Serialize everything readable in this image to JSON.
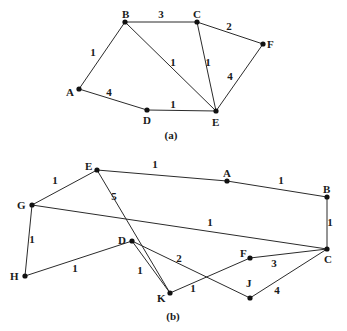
{
  "figures": [
    {
      "id": "a",
      "caption": "(a)",
      "caption_pos": [
        171,
        139
      ],
      "nodes": [
        {
          "id": "A",
          "x": 79,
          "y": 89,
          "lx": 66,
          "ly": 96
        },
        {
          "id": "B",
          "x": 125,
          "y": 22,
          "lx": 122,
          "ly": 18
        },
        {
          "id": "C",
          "x": 197,
          "y": 22,
          "lx": 193,
          "ly": 18
        },
        {
          "id": "D",
          "x": 147,
          "y": 110,
          "lx": 143,
          "ly": 124
        },
        {
          "id": "E",
          "x": 216,
          "y": 111,
          "lx": 212,
          "ly": 126
        },
        {
          "id": "F",
          "x": 263,
          "y": 44,
          "lx": 267,
          "ly": 48
        }
      ],
      "edges": [
        {
          "from": "A",
          "to": "B",
          "weight": "1",
          "wx": 93,
          "wy": 56
        },
        {
          "from": "B",
          "to": "C",
          "weight": "3",
          "wx": 161,
          "wy": 18
        },
        {
          "from": "C",
          "to": "F",
          "weight": "2",
          "wx": 229,
          "wy": 30
        },
        {
          "from": "B",
          "to": "E",
          "weight": "1",
          "wx": 173,
          "wy": 66
        },
        {
          "from": "C",
          "to": "E",
          "weight": "1",
          "wx": 208,
          "wy": 66
        },
        {
          "from": "F",
          "to": "E",
          "weight": "4",
          "wx": 230,
          "wy": 80
        },
        {
          "from": "A",
          "to": "D",
          "weight": "4",
          "wx": 109,
          "wy": 96
        },
        {
          "from": "D",
          "to": "E",
          "weight": "1",
          "wx": 173,
          "wy": 108
        }
      ]
    },
    {
      "id": "b",
      "caption": "(b)",
      "caption_pos": [
        173,
        320
      ],
      "nodes": [
        {
          "id": "E",
          "x": 97,
          "y": 170,
          "lx": 85,
          "ly": 170
        },
        {
          "id": "A",
          "x": 227,
          "y": 181,
          "lx": 223,
          "ly": 177
        },
        {
          "id": "B",
          "x": 327,
          "y": 197,
          "lx": 323,
          "ly": 193
        },
        {
          "id": "G",
          "x": 32,
          "y": 205,
          "lx": 17,
          "ly": 209
        },
        {
          "id": "D",
          "x": 132,
          "y": 241,
          "lx": 118,
          "ly": 244
        },
        {
          "id": "C",
          "x": 327,
          "y": 249,
          "lx": 324,
          "ly": 263
        },
        {
          "id": "F",
          "x": 250,
          "y": 258,
          "lx": 240,
          "ly": 257
        },
        {
          "id": "H",
          "x": 25,
          "y": 276,
          "lx": 10,
          "ly": 280
        },
        {
          "id": "K",
          "x": 170,
          "y": 293,
          "lx": 157,
          "ly": 302
        },
        {
          "id": "J",
          "x": 250,
          "y": 298,
          "lx": 246,
          "ly": 287
        }
      ],
      "edges": [
        {
          "from": "E",
          "to": "A",
          "weight": "1",
          "wx": 155,
          "wy": 168
        },
        {
          "from": "A",
          "to": "B",
          "weight": "1",
          "wx": 281,
          "wy": 184
        },
        {
          "from": "G",
          "to": "E",
          "weight": "1",
          "wx": 55,
          "wy": 184
        },
        {
          "from": "E",
          "to": "K",
          "weight": "5",
          "wx": 114,
          "wy": 200
        },
        {
          "from": "G",
          "to": "C",
          "weight": "1",
          "wx": 210,
          "wy": 226
        },
        {
          "from": "B",
          "to": "C",
          "weight": "1",
          "wx": 330,
          "wy": 226
        },
        {
          "from": "G",
          "to": "H",
          "weight": "1",
          "wx": 32,
          "wy": 243
        },
        {
          "from": "H",
          "to": "D",
          "weight": "1",
          "wx": 75,
          "wy": 272
        },
        {
          "from": "D",
          "to": "J",
          "weight": "2",
          "wx": 179,
          "wy": 262
        },
        {
          "from": "F",
          "to": "C",
          "weight": "3",
          "wx": 274,
          "wy": 267
        },
        {
          "from": "K",
          "to": "F",
          "weight": "1",
          "wx": 193,
          "wy": 292
        },
        {
          "from": "J",
          "to": "C",
          "weight": "4",
          "wx": 277,
          "wy": 294
        },
        {
          "from": "D",
          "to": "K",
          "weight": "1",
          "wx": 140,
          "wy": 274
        }
      ]
    }
  ],
  "footer_faint_text": "Figure 16.5 Find a shortest path..."
}
